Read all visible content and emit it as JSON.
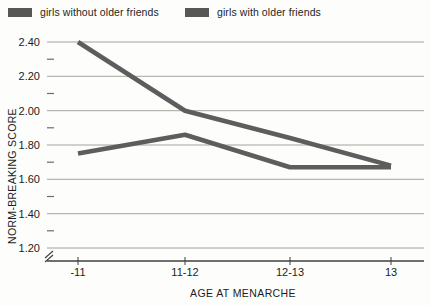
{
  "legend": {
    "items": [
      {
        "label": "girls without older friends"
      },
      {
        "label": "girls with older friends"
      }
    ]
  },
  "chart_data": {
    "type": "line",
    "categories": [
      "-11",
      "11-12",
      "12-13",
      "13"
    ],
    "series": [
      {
        "name": "girls without older friends",
        "values": [
          1.75,
          1.86,
          1.67,
          1.67
        ]
      },
      {
        "name": "girls with older friends",
        "values": [
          2.4,
          2.0,
          1.84,
          1.68
        ]
      }
    ],
    "title": "",
    "xlabel": "AGE AT MENARCHE",
    "ylabel": "NORM-BREAKING SCORE",
    "ylim": [
      1.2,
      2.4
    ],
    "yticks": [
      "2.40",
      "2.20",
      "2.00",
      "1.80",
      "1.60",
      "1.40",
      "1.20"
    ],
    "grid": true,
    "legend_position": "top",
    "axis_break": true,
    "colors": {
      "line": "#5d5d5d",
      "swatch": "#575757",
      "grid": "#a4a39b",
      "axis": "#3f3f3f",
      "text": "#1c1c1c"
    }
  }
}
